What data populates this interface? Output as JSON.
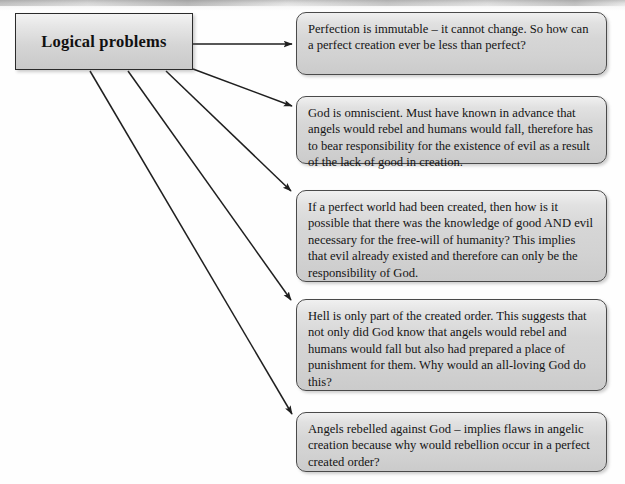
{
  "diagram": {
    "type": "flow-diagram",
    "title": "Logical problems",
    "source_node": {
      "label": "Logical problems"
    },
    "statements": [
      {
        "id": "perfection-immutable",
        "text": "Perfection is immutable – it cannot change. So how can a perfect creation ever be less than perfect?"
      },
      {
        "id": "god-omniscient",
        "text": "God is omniscient. Must have known in advance that angels would rebel and humans would fall, therefore has to bear responsibility for the existence of evil as a result of the lack of good in creation."
      },
      {
        "id": "perfect-world-knowledge",
        "text": "If a perfect world had been created, then how is it possible that there was the knowledge of good AND evil necessary for the free-will of humanity? This implies that evil already existed and therefore can only be the responsibility of God."
      },
      {
        "id": "hell-created-order",
        "text": "Hell is only part of the created order. This suggests that not only did God know that angels would rebel and humans would fall but also had prepared a place of punishment for them. Why would an all-loving God do this?"
      },
      {
        "id": "angels-rebelled",
        "text": "Angels rebelled against God – implies flaws in angelic creation because why would rebellion occur in a perfect created order?"
      }
    ],
    "connectors": [
      {
        "id": "connector-1",
        "from": "source_node",
        "to": "perfection-immutable",
        "style": "straight-arrow"
      },
      {
        "id": "connector-2",
        "from": "source_node",
        "to": "god-omniscient",
        "style": "straight-arrow"
      },
      {
        "id": "connector-3",
        "from": "source_node",
        "to": "perfect-world-knowledge",
        "style": "straight-arrow"
      },
      {
        "id": "connector-4",
        "from": "source_node",
        "to": "hell-created-order",
        "style": "straight-arrow"
      },
      {
        "id": "connector-5",
        "from": "source_node",
        "to": "angels-rebelled",
        "style": "straight-arrow"
      }
    ],
    "colors": {
      "box_fill": "#d6d6d6",
      "box_border": "#4a4a4a",
      "source_border": "#2b2b2b",
      "connector": "#1f1f1f",
      "text": "#141414",
      "page_background": "#fefefe"
    }
  }
}
